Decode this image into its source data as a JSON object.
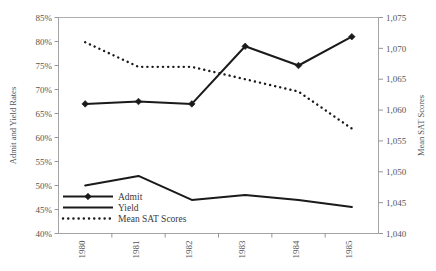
{
  "chart_data": {
    "type": "line",
    "title": "",
    "xlabel": "",
    "categories": [
      "1980",
      "1981",
      "1982",
      "1983",
      "1984",
      "1985"
    ],
    "grid": false,
    "legend_position": "bottom-left",
    "axes": {
      "left": {
        "title": "Admit and Yield Rates",
        "min": 40,
        "max": 85,
        "step": 5,
        "unit": "%",
        "ticks": [
          "40%",
          "45%",
          "50%",
          "55%",
          "60%",
          "65%",
          "70%",
          "75%",
          "80%",
          "85%"
        ],
        "tick_values": [
          40,
          45,
          50,
          55,
          60,
          65,
          70,
          75,
          80,
          85
        ]
      },
      "right": {
        "title": "Mean SAT Scores",
        "min": 1040,
        "max": 1075,
        "step": 5,
        "ticks": [
          "1,040",
          "1,045",
          "1,050",
          "1,055",
          "1,060",
          "1,065",
          "1,070",
          "1,075"
        ],
        "tick_values": [
          1040,
          1045,
          1050,
          1055,
          1060,
          1065,
          1070,
          1075
        ]
      }
    },
    "series": [
      {
        "name": "Admit",
        "axis": "left",
        "style": "solid-marker",
        "marker": "diamond",
        "color": "#1a1a1a",
        "values": [
          67.0,
          67.5,
          67.0,
          79.0,
          75.0,
          81.0
        ]
      },
      {
        "name": "Yield",
        "axis": "left",
        "style": "solid",
        "marker": "none",
        "color": "#1a1a1a",
        "values": [
          50.0,
          52.0,
          47.0,
          48.0,
          47.0,
          45.5
        ]
      },
      {
        "name": "Mean SAT Scores",
        "axis": "right",
        "style": "dotted",
        "marker": "none",
        "color": "#1a1a1a",
        "values": [
          1071,
          1067,
          1067,
          1065,
          1063,
          1057
        ]
      }
    ]
  },
  "legend": {
    "items": [
      {
        "label": "Admit"
      },
      {
        "label": "Yield"
      },
      {
        "label": "Mean SAT Scores"
      }
    ]
  }
}
